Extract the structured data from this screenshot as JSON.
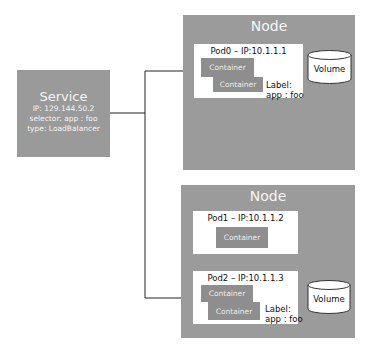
{
  "service": {
    "title": "Service",
    "ip": "IP: 129.144.50.2",
    "selector": "selector: app : foo",
    "type": "type: LoadBalancer"
  },
  "nodes": [
    {
      "title": "Node",
      "pods": [
        {
          "title": "Pod0 – IP:10.1.1.1",
          "containers": [
            "Container",
            "Container"
          ],
          "label_line1": "Label:",
          "label_line2": "app : foo"
        }
      ],
      "volume": "Volume"
    },
    {
      "title": "Node",
      "pods": [
        {
          "title": "Pod1 – IP:10.1.1.2",
          "containers": [
            "Container"
          ]
        },
        {
          "title": "Pod2 – IP:10.1.1.3",
          "containers": [
            "Container",
            "Container"
          ],
          "label_line1": "Label:",
          "label_line2": "app : foo"
        }
      ],
      "volume": "Volume"
    }
  ],
  "colors": {
    "node": "#9b9b9b",
    "container": "#8e8e8e",
    "service": "#9a9a9a",
    "connector": "#222222"
  }
}
